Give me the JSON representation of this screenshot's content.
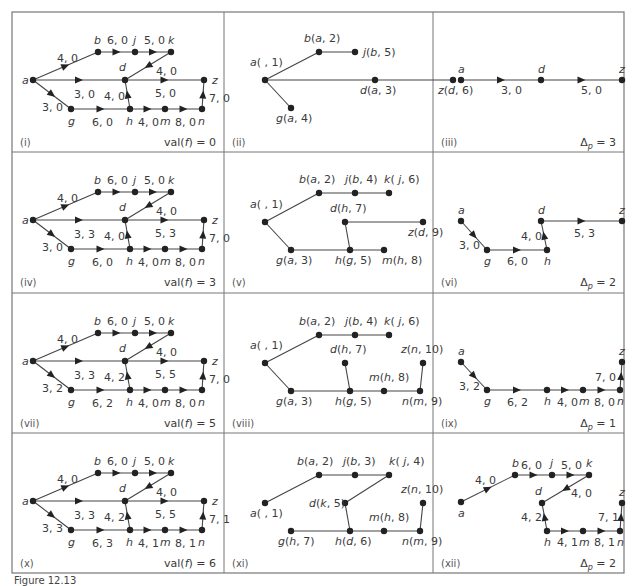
{
  "figure": {
    "caption_partial": "Figure 12.13",
    "grid": {
      "cols": [
        12,
        224,
        433,
        624
      ],
      "rows": [
        12,
        152,
        293,
        433,
        573
      ]
    }
  },
  "colors": {
    "line": "#444444",
    "frame": "#777777",
    "text": "#3a3a3a"
  },
  "panels": [
    {
      "id": "(i)",
      "type": "network",
      "footer": "val(f) = 0",
      "edges": {
        "ab": "4, 0",
        "bj": "6, 0",
        "jk": "5, 0",
        "kd": "4, 0",
        "ad": "3, 0",
        "ag": "3, 0",
        "hd": "4, 0",
        "dz": "5, 0",
        "gh": "6, 0",
        "hm": "4, 0",
        "mn": "8, 0",
        "nz": "7, 0"
      }
    },
    {
      "id": "(ii)",
      "type": "tree",
      "nodes": [
        {
          "name": "a",
          "label": "a( , 1)",
          "x": 41,
          "y": 68,
          "lx": -15,
          "ly": -14
        },
        {
          "name": "b",
          "label": "b(a, 2)",
          "x": 95,
          "y": 40,
          "lx": -15,
          "ly": -10
        },
        {
          "name": "j",
          "label": "j(b, 5)",
          "x": 131,
          "y": 40,
          "lx": 8,
          "ly": 4
        },
        {
          "name": "d",
          "label": "d(a, 3)",
          "x": 151,
          "y": 68,
          "lx": -15,
          "ly": 14
        },
        {
          "name": "z",
          "label": "z(d, 6)",
          "x": 229,
          "y": 68,
          "lx": -15,
          "ly": 14
        },
        {
          "name": "g",
          "label": "g(a, 4)",
          "x": 67,
          "y": 96,
          "lx": -15,
          "ly": 14
        }
      ],
      "links": [
        [
          "a",
          "b"
        ],
        [
          "b",
          "j"
        ],
        [
          "a",
          "d"
        ],
        [
          "d",
          "z"
        ],
        [
          "a",
          "g"
        ]
      ]
    },
    {
      "id": "(iii)",
      "type": "path",
      "footer": "Δp = 3",
      "nodes": [
        {
          "name": "a",
          "x": 28,
          "y": 68,
          "lx": -3,
          "ly": -7
        },
        {
          "name": "d",
          "x": 108,
          "y": 68,
          "lx": -3,
          "ly": -7
        },
        {
          "name": "z",
          "x": 189,
          "y": 68,
          "lx": -3,
          "ly": -7
        }
      ],
      "arcs": [
        {
          "from": "a",
          "to": "d",
          "label": "3, 0",
          "lx": 68,
          "ly": 82
        },
        {
          "from": "d",
          "to": "z",
          "label": "5, 0",
          "lx": 148,
          "ly": 82
        }
      ]
    },
    {
      "id": "(iv)",
      "type": "network",
      "footer": "val(f) = 3",
      "edges": {
        "ab": "4, 0",
        "bj": "6, 0",
        "jk": "5, 0",
        "kd": "4, 0",
        "ad": "3, 3",
        "ag": "3, 0",
        "hd": "4, 0",
        "dz": "5, 3",
        "gh": "6, 0",
        "hm": "4, 0",
        "mn": "8, 0",
        "nz": "7, 0"
      }
    },
    {
      "id": "(v)",
      "type": "tree",
      "nodes": [
        {
          "name": "a",
          "label": "a( , 1)",
          "x": 41,
          "y": 70,
          "lx": -15,
          "ly": -14
        },
        {
          "name": "b",
          "label": "b(a, 2)",
          "x": 95,
          "y": 41,
          "lx": -20,
          "ly": -10
        },
        {
          "name": "j",
          "label": "j(b, 4)",
          "x": 131,
          "y": 41,
          "lx": -10,
          "ly": -10
        },
        {
          "name": "k",
          "label": "k( j, 6)",
          "x": 165,
          "y": 41,
          "lx": -5,
          "ly": -10
        },
        {
          "name": "d",
          "label": "d(h, 7)",
          "x": 121,
          "y": 70,
          "lx": -15,
          "ly": -10
        },
        {
          "name": "z",
          "label": "z(d, 9)",
          "x": 199,
          "y": 70,
          "lx": -15,
          "ly": 14
        },
        {
          "name": "g",
          "label": "g(a, 3)",
          "x": 67,
          "y": 98,
          "lx": -15,
          "ly": 14
        },
        {
          "name": "h",
          "label": "h(g, 5)",
          "x": 126,
          "y": 98,
          "lx": -15,
          "ly": 14
        },
        {
          "name": "m",
          "label": "m(h, 8)",
          "x": 160,
          "y": 98,
          "lx": -2,
          "ly": 14
        }
      ],
      "links": [
        [
          "a",
          "b"
        ],
        [
          "b",
          "j"
        ],
        [
          "j",
          "k"
        ],
        [
          "a",
          "g"
        ],
        [
          "g",
          "h"
        ],
        [
          "h",
          "m"
        ],
        [
          "h",
          "d"
        ],
        [
          "d",
          "z"
        ]
      ]
    },
    {
      "id": "(vi)",
      "type": "path",
      "footer": "Δp = 2",
      "nodes": [
        {
          "name": "a",
          "x": 28,
          "y": 69,
          "lx": -3,
          "ly": -7
        },
        {
          "name": "g",
          "x": 54,
          "y": 98,
          "lx": -3,
          "ly": 15
        },
        {
          "name": "h",
          "x": 114,
          "y": 98,
          "lx": -3,
          "ly": 15
        },
        {
          "name": "d",
          "x": 108,
          "y": 69,
          "lx": -3,
          "ly": -7
        },
        {
          "name": "z",
          "x": 189,
          "y": 69,
          "lx": -3,
          "ly": -7
        }
      ],
      "arcs": [
        {
          "from": "a",
          "to": "g",
          "label": "3, 0",
          "lx": 26,
          "ly": 97
        },
        {
          "from": "g",
          "to": "h",
          "label": "6, 0",
          "lx": 74,
          "ly": 113
        },
        {
          "from": "h",
          "to": "d",
          "label": "4, 0",
          "lx": 88,
          "ly": 88
        },
        {
          "from": "d",
          "to": "z",
          "label": "5, 3",
          "lx": 141,
          "ly": 85
        }
      ]
    },
    {
      "id": "(vii)",
      "type": "network",
      "footer": "val(f) = 5",
      "edges": {
        "ab": "4, 0",
        "bj": "6, 0",
        "jk": "5, 0",
        "kd": "4, 0",
        "ad": "3, 3",
        "ag": "3, 2",
        "hd": "4, 2",
        "dz": "5, 5",
        "gh": "6, 2",
        "hm": "4, 0",
        "mn": "8, 0",
        "nz": "7, 0"
      }
    },
    {
      "id": "(viii)",
      "type": "tree",
      "nodes": [
        {
          "name": "a",
          "label": "a( , 1)",
          "x": 41,
          "y": 70,
          "lx": -15,
          "ly": -14
        },
        {
          "name": "b",
          "label": "b(a, 2)",
          "x": 95,
          "y": 42,
          "lx": -20,
          "ly": -10
        },
        {
          "name": "j",
          "label": "j(b, 4)",
          "x": 131,
          "y": 42,
          "lx": -10,
          "ly": -10
        },
        {
          "name": "k",
          "label": "k( j, 6)",
          "x": 165,
          "y": 42,
          "lx": -5,
          "ly": -10
        },
        {
          "name": "d",
          "label": "d(h, 7)",
          "x": 121,
          "y": 70,
          "lx": -15,
          "ly": -10
        },
        {
          "name": "z",
          "label": "z(n, 10)",
          "x": 199,
          "y": 70,
          "lx": -22,
          "ly": -10
        },
        {
          "name": "g",
          "label": "g(a, 3)",
          "x": 67,
          "y": 98,
          "lx": -15,
          "ly": 14
        },
        {
          "name": "h",
          "label": "h(g, 5)",
          "x": 126,
          "y": 98,
          "lx": -15,
          "ly": 14
        },
        {
          "name": "m",
          "label": "m(h, 8)",
          "x": 160,
          "y": 98,
          "lx": -15,
          "ly": -10
        },
        {
          "name": "n",
          "label": "n(m, 9)",
          "x": 196,
          "y": 98,
          "lx": -18,
          "ly": 14
        }
      ],
      "links": [
        [
          "a",
          "b"
        ],
        [
          "b",
          "j"
        ],
        [
          "j",
          "k"
        ],
        [
          "a",
          "g"
        ],
        [
          "g",
          "h"
        ],
        [
          "h",
          "m"
        ],
        [
          "m",
          "n"
        ],
        [
          "n",
          "z"
        ],
        [
          "h",
          "d"
        ]
      ]
    },
    {
      "id": "(ix)",
      "type": "path",
      "footer": "Δp = 1",
      "nodes": [
        {
          "name": "a",
          "x": 28,
          "y": 69,
          "lx": -3,
          "ly": -7
        },
        {
          "name": "g",
          "x": 54,
          "y": 97,
          "lx": -3,
          "ly": 15
        },
        {
          "name": "h",
          "x": 114,
          "y": 97,
          "lx": -3,
          "ly": 15
        },
        {
          "name": "m",
          "x": 150,
          "y": 97,
          "lx": -4,
          "ly": 15
        },
        {
          "name": "n",
          "x": 187,
          "y": 97,
          "lx": -3,
          "ly": 15
        },
        {
          "name": "z",
          "x": 189,
          "y": 69,
          "lx": -3,
          "ly": -7
        }
      ],
      "arcs": [
        {
          "from": "a",
          "to": "g",
          "label": "3, 2",
          "lx": 26,
          "ly": 97
        },
        {
          "from": "g",
          "to": "h",
          "label": "6, 2",
          "lx": 74,
          "ly": 113
        },
        {
          "from": "h",
          "to": "m",
          "label": "4, 0",
          "lx": 124,
          "ly": 113
        },
        {
          "from": "m",
          "to": "n",
          "label": "8, 0",
          "lx": 161,
          "ly": 113
        },
        {
          "from": "n",
          "to": "z",
          "label": "7, 0",
          "lx": 162,
          "ly": 88
        }
      ]
    },
    {
      "id": "(x)",
      "type": "network",
      "footer": "val(f) = 6",
      "edges": {
        "ab": "4, 0",
        "bj": "6, 0",
        "jk": "5, 0",
        "kd": "4, 0",
        "ad": "3, 3",
        "ag": "3, 3",
        "hd": "4, 2",
        "dz": "5, 5",
        "gh": "6, 3",
        "hm": "4, 1",
        "mn": "8, 1",
        "nz": "7, 1"
      }
    },
    {
      "id": "(xi)",
      "type": "tree",
      "nodes": [
        {
          "name": "a",
          "label": "a( , 1)",
          "x": 41,
          "y": 70,
          "lx": -15,
          "ly": 14
        },
        {
          "name": "b",
          "label": "b(a, 2)",
          "x": 95,
          "y": 42,
          "lx": -22,
          "ly": -10
        },
        {
          "name": "j",
          "label": "j(b, 3)",
          "x": 131,
          "y": 42,
          "lx": -12,
          "ly": -10
        },
        {
          "name": "k",
          "label": "k( j, 4)",
          "x": 165,
          "y": 42,
          "lx": 0,
          "ly": -10
        },
        {
          "name": "d",
          "label": "d(k, 5)",
          "x": 121,
          "y": 70,
          "lx": -36,
          "ly": 4
        },
        {
          "name": "z",
          "label": "z(n, 10)",
          "x": 199,
          "y": 70,
          "lx": -22,
          "ly": -10
        },
        {
          "name": "g",
          "label": "g(h, 7)",
          "x": 67,
          "y": 98,
          "lx": -13,
          "ly": 14
        },
        {
          "name": "h",
          "label": "h(d, 6)",
          "x": 126,
          "y": 98,
          "lx": -15,
          "ly": 14
        },
        {
          "name": "m",
          "label": "m(h, 8)",
          "x": 160,
          "y": 98,
          "lx": -15,
          "ly": -10
        },
        {
          "name": "n",
          "label": "n(m, 9)",
          "x": 196,
          "y": 98,
          "lx": -18,
          "ly": 14
        }
      ],
      "links": [
        [
          "a",
          "b"
        ],
        [
          "b",
          "j"
        ],
        [
          "j",
          "k"
        ],
        [
          "k",
          "d"
        ],
        [
          "d",
          "h"
        ],
        [
          "g",
          "h"
        ],
        [
          "h",
          "m"
        ],
        [
          "m",
          "n"
        ],
        [
          "n",
          "z"
        ]
      ]
    },
    {
      "id": "(xii)",
      "type": "path",
      "footer": "Δp = 2",
      "nodes": [
        {
          "name": "a",
          "x": 28,
          "y": 69,
          "lx": -3,
          "ly": 15
        },
        {
          "name": "b",
          "x": 82,
          "y": 42,
          "lx": -3,
          "ly": -8
        },
        {
          "name": "j",
          "x": 119,
          "y": 42,
          "lx": -2,
          "ly": -8
        },
        {
          "name": "k",
          "x": 156,
          "y": 42,
          "lx": -3,
          "ly": -8
        },
        {
          "name": "d",
          "x": 109,
          "y": 70,
          "lx": -7,
          "ly": -8
        },
        {
          "name": "h",
          "x": 114,
          "y": 98,
          "lx": -3,
          "ly": 15
        },
        {
          "name": "m",
          "x": 150,
          "y": 98,
          "lx": -4,
          "ly": 15
        },
        {
          "name": "n",
          "x": 187,
          "y": 98,
          "lx": -3,
          "ly": 15
        },
        {
          "name": "z",
          "x": 189,
          "y": 70,
          "lx": -3,
          "ly": -7
        }
      ],
      "arcs": [
        {
          "from": "a",
          "to": "b",
          "label": "4, 0",
          "lx": 42,
          "ly": 51
        },
        {
          "from": "b",
          "to": "j",
          "label": "6, 0",
          "lx": 88,
          "ly": 36
        },
        {
          "from": "j",
          "to": "k",
          "label": "5, 0",
          "lx": 128,
          "ly": 36
        },
        {
          "from": "k",
          "to": "d",
          "label": "4, 0",
          "lx": 138,
          "ly": 64
        },
        {
          "from": "h",
          "to": "d",
          "label": "4, 2",
          "lx": 88,
          "ly": 88
        },
        {
          "from": "h",
          "to": "m",
          "label": "4, 1",
          "lx": 124,
          "ly": 113
        },
        {
          "from": "m",
          "to": "n",
          "label": "8, 1",
          "lx": 161,
          "ly": 113
        },
        {
          "from": "n",
          "to": "z",
          "label": "7, 1",
          "lx": 165,
          "ly": 88
        }
      ]
    }
  ]
}
